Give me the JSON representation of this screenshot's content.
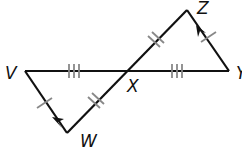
{
  "diagram": {
    "type": "geometry",
    "points": {
      "V": {
        "label": "V",
        "x": 25,
        "y": 71
      },
      "X": {
        "label": "X",
        "x": 126,
        "y": 71
      },
      "Y": {
        "label": "Y",
        "x": 229,
        "y": 71
      },
      "Z": {
        "label": "Z",
        "x": 187,
        "y": 10
      },
      "W": {
        "label": "W",
        "x": 67,
        "y": 133
      }
    },
    "segments": [
      {
        "from": "V",
        "to": "X",
        "ticks": 3
      },
      {
        "from": "X",
        "to": "Y",
        "ticks": 3
      },
      {
        "from": "W",
        "to": "X",
        "ticks": 2
      },
      {
        "from": "X",
        "to": "Z",
        "ticks": 2
      },
      {
        "from": "V",
        "to": "W",
        "ticks": 1,
        "arrow": "toward V"
      },
      {
        "from": "Y",
        "to": "Z",
        "ticks": 1,
        "arrow": "toward Z"
      }
    ],
    "colors": {
      "line": "#111111",
      "tick": "#888888"
    }
  }
}
